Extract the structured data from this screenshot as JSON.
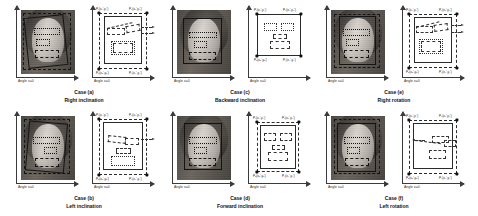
{
  "figure": {
    "axis_label": "Angle x=0",
    "corner_labels": {
      "top_left": "P₁(x₁',y₁')",
      "top_right": "P₂(x₂',y₂')",
      "bottom_left": "P₃(x₃',y₃')",
      "bottom_right": "P₄(x₄',y₄')"
    }
  },
  "cases": [
    {
      "id": "case-a",
      "label": "Case (a)",
      "name": "Right inclination",
      "angle_left": "Angle x=0",
      "angle_right": "Angle x=0"
    },
    {
      "id": "case-b",
      "label": "Case (b)",
      "name": "Left inclination",
      "angle_left": "Angle x=0",
      "angle_right": "Angle x=0"
    },
    {
      "id": "case-c",
      "label": "Case (c)",
      "name": "Backward inclination",
      "angle_left": "Angle x=0",
      "angle_right": "Angle x=0"
    },
    {
      "id": "case-d",
      "label": "Case (d)",
      "name": "Forward inclination",
      "angle_left": "Angle x=0",
      "angle_right": "Angle x=0"
    },
    {
      "id": "case-e",
      "label": "Case (e)",
      "name": "Right rotation",
      "angle_left": "Angle x=0",
      "angle_right": "Angle x=0"
    },
    {
      "id": "case-f",
      "label": "Case (f)",
      "name": "Left rotation",
      "angle_left": "Angle x=0",
      "angle_right": "Angle x=0"
    }
  ],
  "colors": {
    "background": "#ffffff",
    "ink": "#1a1a1a",
    "axis": "#3b3b3b",
    "node": "#111111"
  }
}
